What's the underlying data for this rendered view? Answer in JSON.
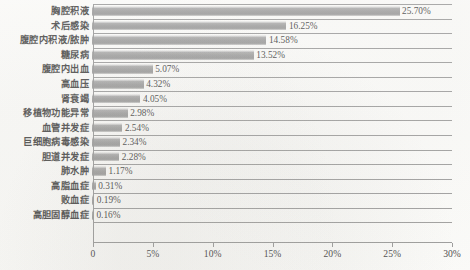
{
  "chart_data": {
    "type": "bar",
    "orientation": "horizontal",
    "title": "",
    "subtitle": "",
    "xlabel": "",
    "ylabel": "",
    "xlim": [
      0,
      30
    ],
    "xunit": "%",
    "grid": true,
    "legend": null,
    "bar_color": "#939393",
    "axis_color": "#8a8a8a",
    "background": "#fbfbf9",
    "xticks": [
      {
        "value": 0,
        "label": "0"
      },
      {
        "value": 5,
        "label": "5%"
      },
      {
        "value": 10,
        "label": "10%"
      },
      {
        "value": 15,
        "label": "15%"
      },
      {
        "value": 20,
        "label": "20%"
      },
      {
        "value": 25,
        "label": "25%"
      },
      {
        "value": 30,
        "label": "30%"
      }
    ],
    "categories": [
      "胸腔积液",
      "术后感染",
      "腹腔内积液/脓肿",
      "糖尿病",
      "腹腔内出血",
      "高血压",
      "肾衰竭",
      "移植物功能异常",
      "血管并发症",
      "巨细胞病毒感染",
      "胆道并发症",
      "肺水肿",
      "高脂血症",
      "败血症",
      "高胆固醇血症"
    ],
    "values": [
      25.7,
      16.25,
      14.58,
      13.52,
      5.07,
      4.32,
      4.05,
      2.98,
      2.54,
      2.34,
      2.28,
      1.17,
      0.31,
      0.19,
      0.16
    ],
    "data_labels": [
      "25.70%",
      "16.25%",
      "14.58%",
      "13.52%",
      "5.07%",
      "4.32%",
      "4.05%",
      "2.98%",
      "2.54%",
      "2.34%",
      "2.28%",
      "1.17%",
      "0.31%",
      "0.19%",
      "0.16%"
    ],
    "points": [
      {
        "category": "胸腔积液",
        "value": 25.7,
        "label": "25.70%"
      },
      {
        "category": "术后感染",
        "value": 16.25,
        "label": "16.25%"
      },
      {
        "category": "腹腔内积液/脓肿",
        "value": 14.58,
        "label": "14.58%"
      },
      {
        "category": "糖尿病",
        "value": 13.52,
        "label": "13.52%"
      },
      {
        "category": "腹腔内出血",
        "value": 5.07,
        "label": "5.07%"
      },
      {
        "category": "高血压",
        "value": 4.32,
        "label": "4.32%"
      },
      {
        "category": "肾衰竭",
        "value": 4.05,
        "label": "4.05%"
      },
      {
        "category": "移植物功能异常",
        "value": 2.98,
        "label": "2.98%"
      },
      {
        "category": "血管并发症",
        "value": 2.54,
        "label": "2.54%"
      },
      {
        "category": "巨细胞病毒感染",
        "value": 2.34,
        "label": "2.34%"
      },
      {
        "category": "胆道并发症",
        "value": 2.28,
        "label": "2.28%"
      },
      {
        "category": "肺水肿",
        "value": 1.17,
        "label": "1.17%"
      },
      {
        "category": "高脂血症",
        "value": 0.31,
        "label": "0.31%"
      },
      {
        "category": "败血症",
        "value": 0.19,
        "label": "0.19%"
      },
      {
        "category": "高胆固醇血症",
        "value": 0.16,
        "label": "0.16%"
      }
    ]
  }
}
